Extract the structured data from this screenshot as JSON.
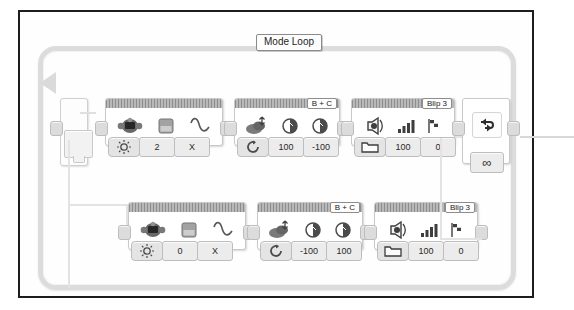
{
  "canvas": {
    "title": "LEGO MINDSTORMS EV3 Program Canvas",
    "background_color": "#ffffff",
    "frame_color": "#1d1d1d",
    "wire_color": "#dcdcdc"
  },
  "loop": {
    "name": "Mode Loop",
    "label": "Mode Loop",
    "end_icon": "loop-arrow-icon",
    "end_condition_value": "∞",
    "end_condition_name": "infinite-loop-icon"
  },
  "switch": {
    "name": "switch-block",
    "flat_view": false,
    "cases": 2
  },
  "branches": [
    {
      "name": "case-top",
      "blocks": [
        {
          "type": "wait-color-sensor",
          "header_port": "",
          "icons": [
            "color-sensor-icon",
            "ambient-light-square-icon",
            "compare-wave-icon"
          ],
          "mode_icon": "brightness-icon",
          "params": [
            "2",
            "X"
          ]
        },
        {
          "type": "move-tank",
          "header_port": "B + C",
          "icons": [
            "move-tank-icon",
            "motor-b-dial-icon",
            "motor-c-dial-icon"
          ],
          "mode_icon": "on-icon",
          "params": [
            "100",
            "-100"
          ]
        },
        {
          "type": "sound",
          "header_port": "Blip 3",
          "icons": [
            "speaker-icon",
            "volume-bars-icon",
            "finish-flag-icon"
          ],
          "mode_icon": "play-file-folder-icon",
          "params": [
            "100",
            "0"
          ]
        }
      ]
    },
    {
      "name": "case-bottom",
      "blocks": [
        {
          "type": "wait-color-sensor",
          "header_port": "",
          "icons": [
            "color-sensor-icon",
            "ambient-light-square-icon",
            "compare-wave-icon"
          ],
          "mode_icon": "brightness-icon",
          "params": [
            "0",
            "X"
          ]
        },
        {
          "type": "move-tank",
          "header_port": "B + C",
          "icons": [
            "move-tank-icon",
            "motor-b-dial-icon",
            "motor-c-dial-icon"
          ],
          "mode_icon": "on-icon",
          "params": [
            "-100",
            "100"
          ]
        },
        {
          "type": "sound",
          "header_port": "Blip 3",
          "icons": [
            "speaker-icon",
            "volume-bars-icon",
            "finish-flag-icon"
          ],
          "mode_icon": "play-file-folder-icon",
          "params": [
            "100",
            "0"
          ]
        }
      ]
    }
  ]
}
